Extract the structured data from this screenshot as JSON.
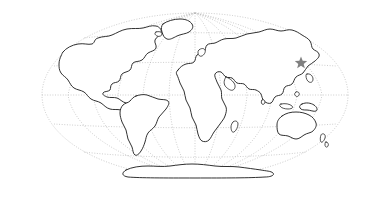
{
  "figure": {
    "name": "world-map-outline",
    "background_color": "#ffffff",
    "width": 389,
    "height": 201
  },
  "projection": {
    "type": "mollweide-ellipse",
    "center_x": 195,
    "center_y": 95,
    "radius_x": 153,
    "radius_y": 82,
    "outline_color": "#bdbdbd",
    "outline_style": "dotted"
  },
  "graticule": {
    "visible": true,
    "style": "dotted",
    "color": "#b9b9b9",
    "parallels": [
      60,
      30,
      0,
      -30,
      -60
    ],
    "meridians": [
      -150,
      -120,
      -90,
      -60,
      -30,
      0,
      30,
      60,
      90,
      120,
      150
    ],
    "equator_y": 95
  },
  "land": {
    "stroke_color": "#1a1a1a",
    "fill_color": "#ffffff",
    "features": [
      {
        "name": "north-america",
        "label": "North America"
      },
      {
        "name": "greenland",
        "label": "Greenland"
      },
      {
        "name": "south-america",
        "label": "South America"
      },
      {
        "name": "africa-eurasia",
        "label": "Africa and Eurasia"
      },
      {
        "name": "british-isles",
        "label": "British Isles"
      },
      {
        "name": "madagascar",
        "label": "Madagascar"
      },
      {
        "name": "japan",
        "label": "Japan"
      },
      {
        "name": "new-guinea",
        "label": "New Guinea"
      },
      {
        "name": "australia",
        "label": "Australia"
      },
      {
        "name": "new-zealand",
        "label": "New Zealand"
      },
      {
        "name": "antarctica",
        "label": "Antarctica"
      },
      {
        "name": "iceland",
        "label": "Iceland"
      },
      {
        "name": "sri-lanka",
        "label": "Sri Lanka"
      },
      {
        "name": "philippines",
        "label": "Philippines"
      },
      {
        "name": "indonesia",
        "label": "Indonesia"
      }
    ]
  },
  "markers": [
    {
      "name": "location-star-east-asia",
      "shape": "star",
      "points": 5,
      "color": "#808080",
      "x": 301,
      "y": 63,
      "size": 13,
      "region": "East Asia"
    }
  ]
}
